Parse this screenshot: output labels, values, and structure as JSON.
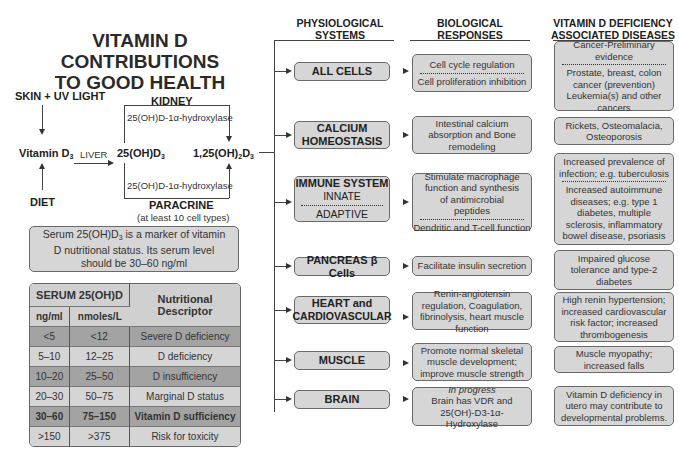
{
  "title": {
    "line1": "VITAMIN D CONTRIBUTIONS",
    "line2": "TO GOOD HEALTH"
  },
  "pathway": {
    "source_top": "SKIN + UV LIGHT",
    "source_bottom": "DIET",
    "vitamin_d3": "Vitamin D",
    "vitamin_d3_sub": "3",
    "liver": "LIVER",
    "metabolite": "25(OH)D",
    "metabolite_sub": "3",
    "active_prefix": "1,25(OH)",
    "active_sub1": "2",
    "active_mid": "D",
    "active_sub2": "3",
    "kidney": "KIDNEY",
    "paracrine": "PARACRINE",
    "paracrine_note": "(at least 10 cell types)",
    "enzyme_top": "25(OH)D-1α-hydroxylase",
    "enzyme_bottom": "25(OH)D-1α-hydroxylase"
  },
  "note": {
    "prefix": "Serum 25(OH)D",
    "sub": "3",
    "text": " is a marker of vitamin D nutritional status. Its serum level should be 30–60 ng/ml"
  },
  "serum_table": {
    "header_group": "SERUM 25(OH)D",
    "header_desc": "Nutritional Descriptor",
    "col_ng": "ng/ml",
    "col_nmol": "nmoles/L",
    "rows": [
      {
        "ng": "<5",
        "nmol": "<12",
        "desc": "Severe D deficiency",
        "shade": "dark"
      },
      {
        "ng": "5–10",
        "nmol": "12–25",
        "desc": "D deficiency",
        "shade": "light"
      },
      {
        "ng": "10–20",
        "nmol": "25–50",
        "desc": "D insufficiency",
        "shade": "dark"
      },
      {
        "ng": "20–30",
        "nmol": "50–75",
        "desc": "Marginal D status",
        "shade": "light"
      },
      {
        "ng": "30–60",
        "nmol": "75–150",
        "desc": "Vitamin D sufficiency",
        "shade": "dark",
        "bold": true
      },
      {
        "ng": ">150",
        "nmol": ">375",
        "desc": "Risk for toxicity",
        "shade": "light"
      }
    ]
  },
  "columns": {
    "systems": "PHYSIOLOGICAL SYSTEMS",
    "responses": "BIOLOGICAL RESPONSES",
    "diseases": "VITAMIN D DEFICIENCY ASSOCIATED DISEASES"
  },
  "rows": [
    {
      "system": [
        "ALL CELLS"
      ],
      "system_split": null,
      "response_a": "Cell cycle regulation",
      "response_b": "Cell proliferation inhibition",
      "disease_a": "Cancer-Preliminary evidence",
      "disease_b": "Prostate, breast, colon cancer (prevention) Leukemia(s) and other cancers"
    },
    {
      "system": [
        "CALCIUM",
        "HOMEOSTASIS"
      ],
      "system_split": null,
      "response_a": "Intestinal calcium absorption and Bone remodeling",
      "response_b": null,
      "disease_a": "Rickets, Osteomalacia, Osteoporosis",
      "disease_b": null
    },
    {
      "system": [
        "IMMUNE SYSTEM"
      ],
      "system_split": {
        "a": "INNATE",
        "b": "ADAPTIVE"
      },
      "response_a": "Stimulate macrophage function and synthesis of antimicrobial peptides",
      "response_b": "Dendritic and T-cell function",
      "disease_a": "Increased prevalence of infection; e.g. tuberculosis",
      "disease_b": "Increased autoimmune diseases; e.g. type 1 diabetes, multiple sclerosis, inflammatory bowel disease, psoriasis"
    },
    {
      "system": [
        "PANCREAS β Cells"
      ],
      "system_split": null,
      "response_a": "Facilitate insulin secretion",
      "response_b": null,
      "disease_a": "Impaired glucose tolerance and type-2 diabetes",
      "disease_b": null
    },
    {
      "system": [
        "HEART and",
        "CARDIOVASCULAR"
      ],
      "system_split": null,
      "response_a": "Renin-angiotensin regulation, Coagulation, fibrinolysis, heart muscle function",
      "response_b": null,
      "disease_a": "High renin hypertension; increased cardiovascular risk factor; increased thrombogenesis",
      "disease_b": null
    },
    {
      "system": [
        "MUSCLE"
      ],
      "system_split": null,
      "response_a": "Promote normal skeletal muscle development; improve muscle strength",
      "response_b": null,
      "disease_a": "Muscle myopathy; increased falls",
      "disease_b": null
    },
    {
      "system": [
        "BRAIN"
      ],
      "system_split": null,
      "response_italic": "In progress",
      "response_a": "Brain has VDR and 25(OH)-D3-1α-Hydroxylase",
      "response_b": null,
      "disease_a": "Vitamin D deficiency in utero may contribute to developmental problems.",
      "disease_b": null
    }
  ]
}
